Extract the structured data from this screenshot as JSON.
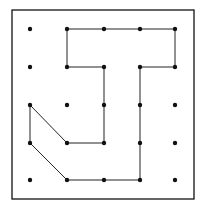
{
  "diagram": {
    "type": "geoboard-dot-grid",
    "grid": {
      "cols": 5,
      "rows": 5
    },
    "frame": {
      "x": 12,
      "y": 10,
      "width": 182,
      "height": 189,
      "stroke": "#111111"
    },
    "grid_x": [
      30,
      67,
      104,
      140,
      175
    ],
    "grid_y": [
      29,
      67,
      105,
      143,
      180
    ],
    "dot_color": "#111111",
    "line_color": "#222222",
    "path_points": [
      [
        2,
        1
      ],
      [
        3,
        1
      ],
      [
        4,
        1
      ],
      [
        5,
        1
      ],
      [
        5,
        2
      ],
      [
        4,
        2
      ],
      [
        4,
        3
      ],
      [
        4,
        4
      ],
      [
        4,
        5
      ],
      [
        3,
        5
      ],
      [
        2,
        5
      ],
      [
        1,
        4
      ],
      [
        1,
        3
      ],
      [
        2,
        4
      ],
      [
        3,
        4
      ],
      [
        3,
        3
      ],
      [
        3,
        2
      ],
      [
        2,
        2
      ]
    ],
    "closed": true
  }
}
